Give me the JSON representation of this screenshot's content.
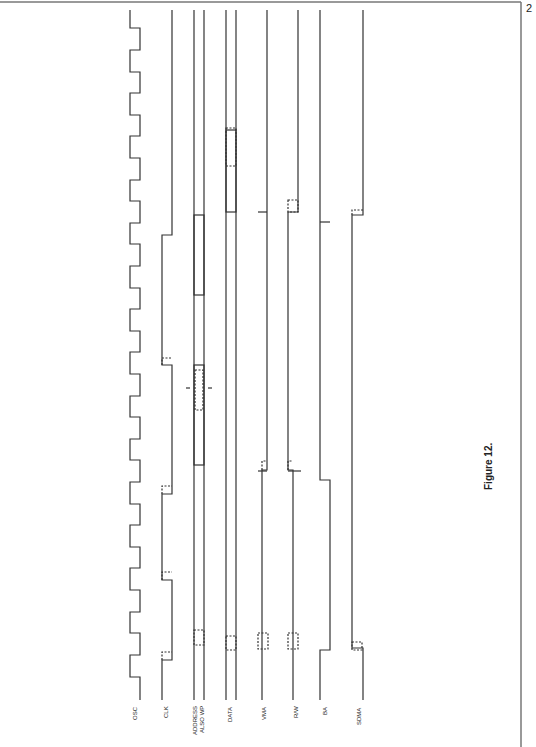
{
  "page": {
    "number": "2",
    "border_color": "#777777"
  },
  "figure": {
    "caption": "Figure 12.",
    "orientation": "rotated-90-ccw"
  },
  "signals": [
    {
      "name": "OSC",
      "label": "OSC",
      "x": 135
    },
    {
      "name": "CLK",
      "label": "CLK",
      "x": 170
    },
    {
      "name": "ADDRESS",
      "label": "ADDRESS",
      "label2": "ALSO WP",
      "x": 199
    },
    {
      "name": "DATA",
      "label": "DATA",
      "x": 231
    },
    {
      "name": "VMA",
      "label": "VMA",
      "x": 266
    },
    {
      "name": "RW",
      "label": "R/W",
      "x": 298
    },
    {
      "name": "BA",
      "label": "BA",
      "x": 322
    },
    {
      "name": "SDMA",
      "label": "SDMA",
      "x": 359
    }
  ],
  "colors": {
    "line": "#333333",
    "background": "#ffffff"
  }
}
